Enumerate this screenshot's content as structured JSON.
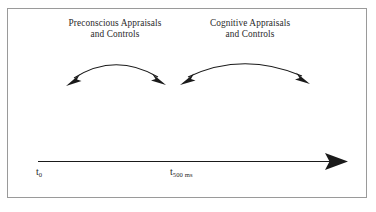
{
  "figure": {
    "background_color": "#ffffff",
    "frame_color": "#9a9a9a",
    "ink_color": "#1a1a1a",
    "text_color": "#2a2a2a",
    "captions": {
      "left": {
        "line1": "Preconscious Appraisals",
        "line2": "and Controls"
      },
      "right": {
        "line1": "Cognitive Appraisals",
        "line2": "and Controls"
      }
    },
    "timeline": {
      "start_label_base": "t",
      "start_label_sub": "0",
      "mid_label_base": "t",
      "mid_label_sub": "500 ms",
      "direction": "left-to-right",
      "arrowhead": "solid-triangle"
    },
    "arcs": [
      {
        "name": "preconscious-arc",
        "style": "double-headed-curved-arrow",
        "spans_label": "Preconscious Appraisals and Controls"
      },
      {
        "name": "cognitive-arc",
        "style": "double-headed-curved-arrow",
        "spans_label": "Cognitive Appraisals and Controls"
      }
    ]
  }
}
